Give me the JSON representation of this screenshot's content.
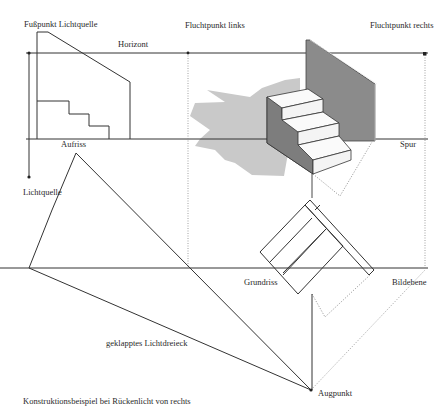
{
  "labels": {
    "fusspunkt_lichtquelle": "Fußpunkt Lichtquelle",
    "fluchtpunkt_links": "Fluchtpunkt links",
    "fluchtpunkt_rechts": "Fluchtpunkt rechts",
    "horizont": "Horizont",
    "aufriss": "Aufriss",
    "spur": "Spur",
    "lichtquelle": "Lichtquelle",
    "grundriss": "Grundriss",
    "bildebene": "Bildebene",
    "geklapptes_lichtdreieck": "geklapptes Lichtdreieck",
    "augpunkt": "Augpunkt",
    "caption": "Konstruktionsbeispiel bei Rückenlicht von rechts"
  },
  "colors": {
    "line": "#333333",
    "wall": "#8a8a8a",
    "stair_side": "#7d7d7d",
    "shadow": "#c8c8c8",
    "dotted": "#888888"
  }
}
